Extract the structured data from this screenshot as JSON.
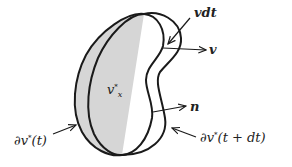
{
  "diagram": {
    "type": "control-volume",
    "colors": {
      "fill": "#d6d6d6",
      "stroke": "#1a1a1a",
      "background": "#ffffff"
    },
    "labels": {
      "vdt": "vdt",
      "v": "v",
      "n": "n",
      "region": "v",
      "region_sup": "*",
      "region_sub": "x",
      "boundary_t": "∂v",
      "boundary_t_sup": "*",
      "boundary_t_arg": "(t)",
      "boundary_tdt": "∂v",
      "boundary_tdt_sup": "*",
      "boundary_tdt_arg": "(t + dt)"
    }
  }
}
